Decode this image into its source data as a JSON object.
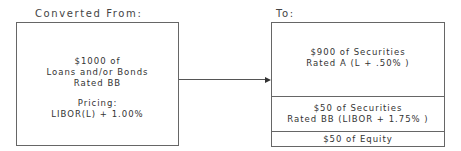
{
  "source": {
    "title": "Converted From:",
    "lines": [
      "$1000  of",
      "Loans and/or Bonds",
      "Rated   BB"
    ],
    "pricing_label": "Pricing:",
    "pricing_value": "LIBOR(L)  +  1.00%"
  },
  "target": {
    "title": "To:",
    "tranches": [
      {
        "line1": "$900 of Securities",
        "line2": "Rated   A   (L + .50% )"
      },
      {
        "line1": "$50 of Securities",
        "line2": "Rated   BB  (LIBOR  + 1.75% )"
      },
      {
        "line1": "$50 of Equity"
      }
    ]
  },
  "colors": {
    "border": "#666666",
    "text": "#333333"
  }
}
